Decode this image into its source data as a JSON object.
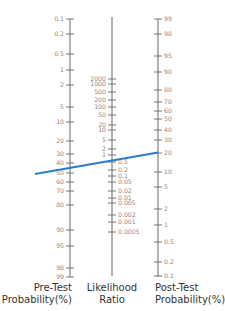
{
  "colors": {
    "axis": "#666666",
    "tick_label": "#8a8a8a",
    "axis_title": "#333333",
    "line": "#2a7bc8"
  },
  "chart_data": {
    "type": "nomogram",
    "axes": [
      {
        "name": "Pre-Test Probability (%)",
        "title_lines": [
          "Pre-Test",
          "Probability(%)"
        ],
        "ticks": [
          0.1,
          0.2,
          0.5,
          1,
          2,
          5,
          10,
          20,
          30,
          40,
          50,
          60,
          70,
          80,
          90,
          95,
          98,
          99
        ],
        "direction": "top-to-bottom ascending"
      },
      {
        "name": "Likelihood Ratio",
        "title_lines": [
          "Likelihood",
          "Ratio"
        ],
        "ticks": [
          2000,
          1000,
          500,
          200,
          100,
          50,
          20,
          10,
          5,
          2,
          1,
          0.5,
          0.2,
          0.1,
          0.05,
          0.02,
          0.01,
          0.005,
          0.002,
          0.001,
          0.0005
        ],
        "direction": "top-to-bottom descending"
      },
      {
        "name": "Post-Test Probability (%)",
        "title_lines": [
          "Post-Test",
          "Probability(%)"
        ],
        "ticks": [
          99,
          98,
          95,
          90,
          80,
          70,
          60,
          50,
          40,
          30,
          20,
          10,
          5,
          2,
          1,
          0.5,
          0.2,
          0.1
        ],
        "direction": "top-to-bottom descending"
      }
    ],
    "line": {
      "pre_test_probability": 50,
      "likelihood_ratio": 0.25,
      "post_test_probability": 20
    }
  },
  "pre": {
    "title1": "Pre-Test",
    "title2": "Probability(%)",
    "ticks": [
      {
        "label": "0.1",
        "y": 19
      },
      {
        "label": "0.2",
        "y": 34
      },
      {
        "label": "0.5",
        "y": 54
      },
      {
        "label": "1",
        "y": 70
      },
      {
        "label": "2",
        "y": 85
      },
      {
        "label": "5",
        "y": 107
      },
      {
        "label": "10",
        "y": 122
      },
      {
        "label": "20",
        "y": 141
      },
      {
        "label": "30",
        "y": 154
      },
      {
        "label": "40",
        "y": 163
      },
      {
        "label": "50",
        "y": 173
      },
      {
        "label": "60",
        "y": 182
      },
      {
        "label": "70",
        "y": 191
      },
      {
        "label": "80",
        "y": 205
      },
      {
        "label": "90",
        "y": 230
      },
      {
        "label": "95",
        "y": 246
      },
      {
        "label": "98",
        "y": 268
      },
      {
        "label": "99",
        "y": 277
      }
    ]
  },
  "lr": {
    "title1": "Likelihood",
    "title2": "Ratio",
    "ticks_left": [
      {
        "label": "2000",
        "y": 79
      },
      {
        "label": "1000",
        "y": 84
      },
      {
        "label": "500",
        "y": 92
      },
      {
        "label": "200",
        "y": 100
      },
      {
        "label": "100",
        "y": 107
      },
      {
        "label": "50",
        "y": 115
      },
      {
        "label": "20",
        "y": 125
      },
      {
        "label": "10",
        "y": 130
      },
      {
        "label": "5",
        "y": 140
      },
      {
        "label": "2",
        "y": 149
      },
      {
        "label": "1",
        "y": 155
      }
    ],
    "ticks_right": [
      {
        "label": "0.5",
        "y": 162
      },
      {
        "label": "0.2",
        "y": 170
      },
      {
        "label": "0.1",
        "y": 176
      },
      {
        "label": "0.05",
        "y": 182
      },
      {
        "label": "0.02",
        "y": 191
      },
      {
        "label": "0.01",
        "y": 198
      },
      {
        "label": "0.005",
        "y": 203
      },
      {
        "label": "0.002",
        "y": 215
      },
      {
        "label": "0.001",
        "y": 222
      },
      {
        "label": "0.0005",
        "y": 232
      }
    ]
  },
  "post": {
    "title1": "Post-Test",
    "title2": "Probability(%)",
    "ticks": [
      {
        "label": "99",
        "y": 19
      },
      {
        "label": "98",
        "y": 34
      },
      {
        "label": "95",
        "y": 56
      },
      {
        "label": "90",
        "y": 72
      },
      {
        "label": "80",
        "y": 90
      },
      {
        "label": "70",
        "y": 102
      },
      {
        "label": "60",
        "y": 111
      },
      {
        "label": "50",
        "y": 119
      },
      {
        "label": "40",
        "y": 130
      },
      {
        "label": "30",
        "y": 140
      },
      {
        "label": "20",
        "y": 153
      },
      {
        "label": "10",
        "y": 172
      },
      {
        "label": "5",
        "y": 187
      },
      {
        "label": "2",
        "y": 209
      },
      {
        "label": "1",
        "y": 225
      },
      {
        "label": "0.5",
        "y": 242
      },
      {
        "label": "0.2",
        "y": 262
      },
      {
        "label": "0.1",
        "y": 276
      }
    ]
  }
}
